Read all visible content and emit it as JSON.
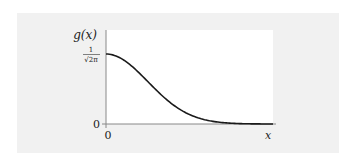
{
  "chart_data": {
    "type": "line",
    "title": "",
    "xlabel": "x",
    "ylabel": "g(x)",
    "x_ticks": [
      "0"
    ],
    "y_ticks": [
      "0",
      "1/√(2π)"
    ],
    "y_tick_top": {
      "num": "1",
      "den": "√2π"
    },
    "grid": false,
    "legend": null,
    "series": [
      {
        "name": "g(x) = (1/√(2π)) e^(-x²/2)",
        "x": [
          0,
          0.5,
          1,
          1.5,
          2,
          2.5,
          3,
          3.5,
          4
        ],
        "y": [
          0.399,
          0.352,
          0.242,
          0.13,
          0.054,
          0.018,
          0.004,
          0.001,
          0.0001
        ]
      }
    ],
    "xlim": [
      0,
      4
    ],
    "ylim": [
      0,
      0.53
    ]
  },
  "labels": {
    "y_axis": "g(x)",
    "x_axis": "x",
    "y_zero": "0",
    "x_zero": "0",
    "y_top_num": "1",
    "y_top_den": "√2π"
  },
  "colors": {
    "panel": "#f1f1f1",
    "plot_bg": "#ffffff",
    "curve": "#1a1a1a",
    "axis": "#888888"
  }
}
